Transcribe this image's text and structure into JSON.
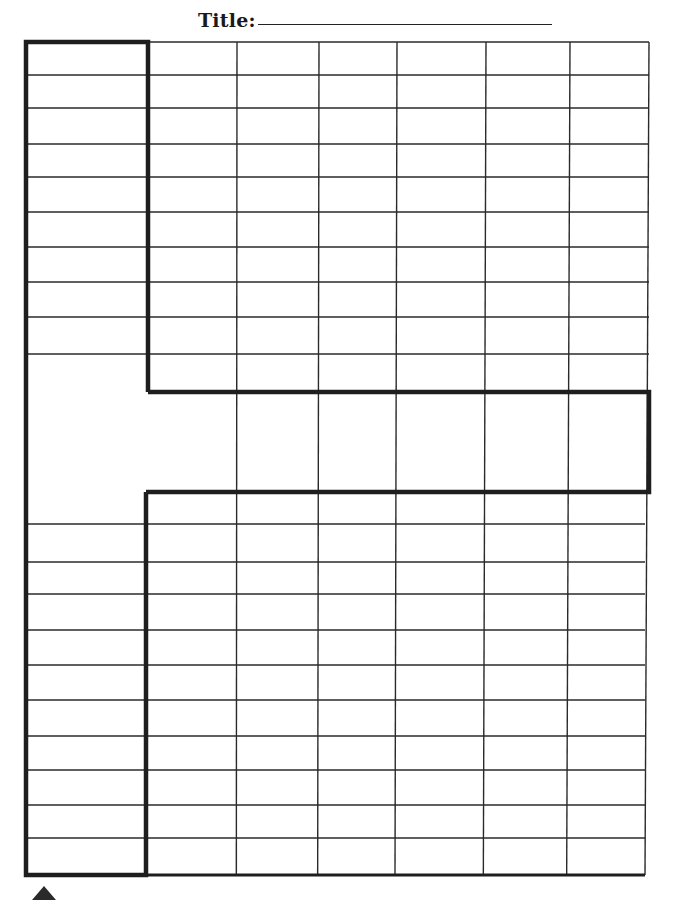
{
  "worksheet": {
    "title_label": "Title:",
    "title_value": "",
    "colors": {
      "line": "#2a2a2a",
      "thick_line": "#1e1e1e",
      "paper": "#ffffff"
    },
    "grid": {
      "left_column_x": [
        26,
        148
      ],
      "data_columns_x": [
        148,
        237,
        319,
        397,
        486,
        570,
        649
      ],
      "top_block_rows_y": [
        42,
        75,
        108,
        144,
        177,
        212,
        247,
        282,
        317,
        354
      ],
      "top_right_rows_y": [
        354,
        392
      ],
      "middle_band_y": [
        392,
        492
      ],
      "bottom_block_rows_y": [
        492,
        524,
        562,
        594,
        630,
        665,
        700,
        736,
        770,
        805,
        838,
        875
      ],
      "left_column_bottom_rows_y": [
        524,
        562,
        594,
        630,
        665,
        700,
        736,
        770,
        805,
        838,
        875
      ],
      "data_column_count": 6,
      "top_left_row_count": 9,
      "bottom_left_row_count": 10
    },
    "footer_marker": "up-arrow"
  }
}
